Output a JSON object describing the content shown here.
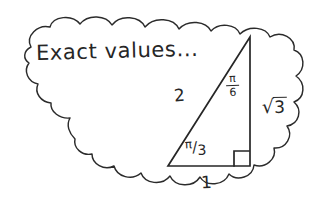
{
  "canvas": {
    "width": 329,
    "height": 222,
    "background_color": "#ffffff",
    "ink_color": "#262626",
    "style": "hand-drawn pencil sketch"
  },
  "thought_bubble": {
    "name": "cloud-outline",
    "shape": "scalloped thought cloud",
    "stroke_color": "#2b2b2b"
  },
  "title": {
    "text": "Exact values...",
    "style": "handwritten"
  },
  "triangle": {
    "description": "right triangle 30-60-90",
    "vertices": {
      "apex": [
        250,
        37
      ],
      "bottom_left": [
        168,
        166
      ],
      "bottom_right": [
        250,
        166
      ]
    },
    "labels": {
      "hypotenuse": "2",
      "base": "1",
      "vertical": {
        "radical": "√",
        "radicand": "3",
        "text": "√3"
      },
      "angle_top": {
        "numerator": "π",
        "denominator": "6",
        "text": "π/6"
      },
      "angle_bottom": {
        "numerator": "π",
        "slash": "/",
        "denominator": "3",
        "text": "π/3"
      }
    },
    "right_angle_marker": {
      "name": "right-angle-square",
      "position": "bottom-right vertex"
    }
  }
}
